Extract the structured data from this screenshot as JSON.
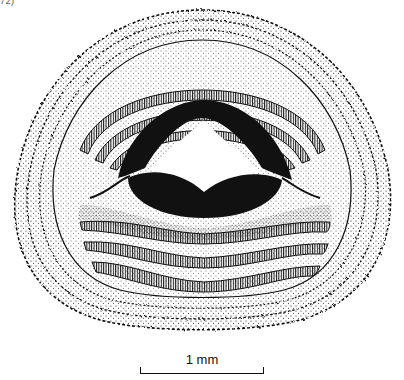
{
  "caption_fragment": "72)",
  "figure": {
    "parts": [
      "marginal-papillae",
      "upper-tooth-rows",
      "upper-jaw-sheath",
      "lower-jaw-sheath",
      "lower-tooth-rows",
      "oral-disc"
    ],
    "upper_tooth_rows": 3,
    "lower_tooth_rows": 3,
    "colors": {
      "ink": "#111111",
      "background": "#ffffff"
    }
  },
  "scale_bar": {
    "label": "1 mm"
  }
}
